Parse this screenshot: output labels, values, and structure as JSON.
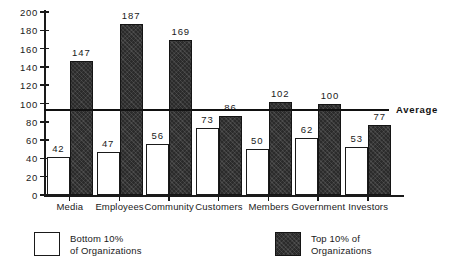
{
  "chart_data": {
    "type": "bar",
    "title": "",
    "xlabel": "",
    "ylabel": "",
    "ylim": [
      0,
      200
    ],
    "y_ticks": [
      0,
      20,
      40,
      60,
      80,
      100,
      120,
      140,
      160,
      180,
      200
    ],
    "grid": false,
    "legend_position": "bottom",
    "categories": [
      "Media",
      "Employees",
      "Community",
      "Customers",
      "Members",
      "Government",
      "Investors"
    ],
    "series": [
      {
        "name": "Bottom 10% of Organizations",
        "style": "hollow",
        "color": "#ffffff",
        "values": [
          42,
          47,
          56,
          73,
          50,
          62,
          53
        ]
      },
      {
        "name": "Top 10% of Organizations",
        "style": "filled",
        "color": "#2b2b2b",
        "values": [
          147,
          187,
          169,
          86,
          102,
          100,
          77
        ]
      }
    ],
    "annotations": [
      {
        "type": "reference-line",
        "label": "Average",
        "value": 93,
        "orientation": "horizontal"
      }
    ]
  },
  "legend": {
    "items": [
      {
        "label_line1": "Bottom  10%",
        "label_line2": "of Organizations",
        "swatch": "hollow-swatch"
      },
      {
        "label_line1": "Top 10% of",
        "label_line2": "Organizations",
        "swatch": "filled-swatch"
      }
    ]
  }
}
